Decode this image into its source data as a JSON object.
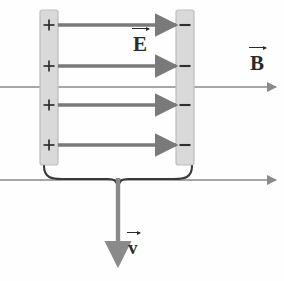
{
  "figure": {
    "width": 284,
    "height": 281,
    "background_color": "#fefefe"
  },
  "colors": {
    "plate_fill": "#d9d9d9",
    "plate_stroke": "#b0b0b0",
    "field_arrow": "#7a7a7a",
    "b_line": "#8a8a8a",
    "velocity_arrow": "#8a8a8a",
    "brace": "#3a3a3a",
    "text": "#2b2b2b",
    "sign": "#2f2f2f"
  },
  "plates": {
    "left": {
      "name": "positive-plate",
      "charge_sign": "+",
      "sign_count": 4,
      "x": 40,
      "y": 10,
      "width": 18,
      "height": 155
    },
    "right": {
      "name": "negative-plate",
      "charge_sign": "−",
      "sign_count": 4,
      "x": 176,
      "y": 10,
      "width": 18,
      "height": 155
    }
  },
  "electric_field": {
    "label": "E",
    "label_x": 133,
    "label_y": 34,
    "direction": "right",
    "arrow_count": 4,
    "arrow_x_start": 58,
    "arrow_x_end": 179,
    "arrow_rows_y": [
      25,
      66,
      105,
      145
    ]
  },
  "magnetic_field": {
    "label": "B",
    "label_x": 250,
    "label_y": 53,
    "direction": "right",
    "line_count": 2,
    "lines_y": [
      87,
      180
    ],
    "x_start": 0,
    "x_end": 278
  },
  "velocity": {
    "label": "v",
    "label_x": 128,
    "label_y": 238,
    "direction": "down",
    "x": 118,
    "y_start": 178,
    "y_end": 266
  },
  "brace": {
    "name": "plate-separation-brace",
    "orientation": "down",
    "x_left": 44,
    "x_right": 192,
    "y_top": 168,
    "center_x": 118
  },
  "charge_signs": {
    "positive": "+",
    "negative": "−"
  }
}
